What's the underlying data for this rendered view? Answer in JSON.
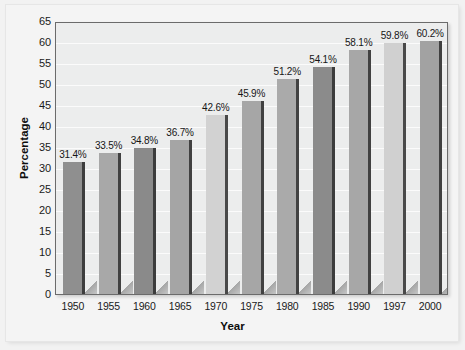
{
  "chart_data": {
    "type": "bar",
    "title": "",
    "xlabel": "Year",
    "ylabel": "Percentage",
    "categories": [
      "1950",
      "1955",
      "1960",
      "1965",
      "1970",
      "1975",
      "1980",
      "1985",
      "1990",
      "1997",
      "2000"
    ],
    "values": [
      31.4,
      33.5,
      34.8,
      36.7,
      42.6,
      45.9,
      51.2,
      54.1,
      58.1,
      59.8,
      60.2
    ],
    "data_labels": [
      "31.4%",
      "33.5%",
      "34.8%",
      "36.7%",
      "42.6%",
      "45.9%",
      "51.2%",
      "54.1%",
      "58.1%",
      "59.8%",
      "60.2%"
    ],
    "bar_colors": [
      "#8f8f8f",
      "#a8a8a8",
      "#8a8a8a",
      "#a5a5a5",
      "#d2d2d2",
      "#a6a6a6",
      "#aaaaaa",
      "#8b8b8b",
      "#a7a7a7",
      "#d0d0d0",
      "#a2a2a2"
    ],
    "ylim": [
      0,
      65
    ],
    "ytick_step": 5,
    "yticks": [
      "0",
      "5",
      "10",
      "15",
      "20",
      "25",
      "30",
      "35",
      "40",
      "45",
      "50",
      "55",
      "60",
      "65"
    ],
    "grid": true,
    "legend": "none",
    "plot_background": "#eceded",
    "page_background": "#f2f2f2",
    "axis_color": "#6b6b6b",
    "text_color": "#1a1a1a"
  }
}
